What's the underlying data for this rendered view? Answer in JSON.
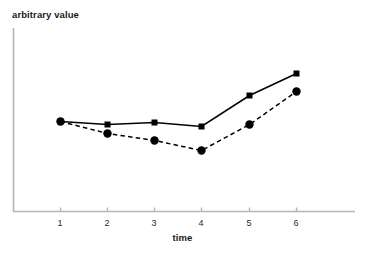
{
  "chart_data": {
    "type": "line",
    "title": "",
    "subtitle": "",
    "xlabel": "time",
    "ylabel": "arbitrary value",
    "x": [
      1,
      2,
      3,
      4,
      5,
      6
    ],
    "categories": [
      "1",
      "2",
      "3",
      "4",
      "5",
      "6"
    ],
    "xlim": [
      0.4,
      6.6
    ],
    "ylim": [
      0,
      100
    ],
    "grid": false,
    "legend": null,
    "legend_position": "none",
    "annotations": [],
    "axis_color": "#b5b5b5",
    "series": [
      {
        "name": "series-solid",
        "marker": "square",
        "linestyle": "solid",
        "color": "#000000",
        "values": [
          48,
          46,
          47,
          45,
          62,
          74
        ],
        "pixel_y": [
          121,
          124,
          122,
          126,
          95,
          73
        ]
      },
      {
        "name": "series-dashed",
        "marker": "circle",
        "linestyle": "dashed",
        "color": "#000000",
        "values": [
          48,
          41,
          37,
          31,
          46,
          58
        ],
        "pixel_y": [
          121,
          133,
          140,
          150,
          124,
          91
        ]
      }
    ]
  },
  "axes": {
    "x_tick_labels": [
      "1",
      "2",
      "3",
      "4",
      "5",
      "6"
    ],
    "x_tick_px": [
      60,
      107,
      154,
      201,
      249,
      296
    ],
    "y_tick_labels": [],
    "origin_px": {
      "x": 13,
      "y": 211
    },
    "x_axis_end_px": 355,
    "y_axis_top_px": 28
  },
  "labels": {
    "y_axis_title": "arbitrary value",
    "x_axis_title": "time"
  }
}
